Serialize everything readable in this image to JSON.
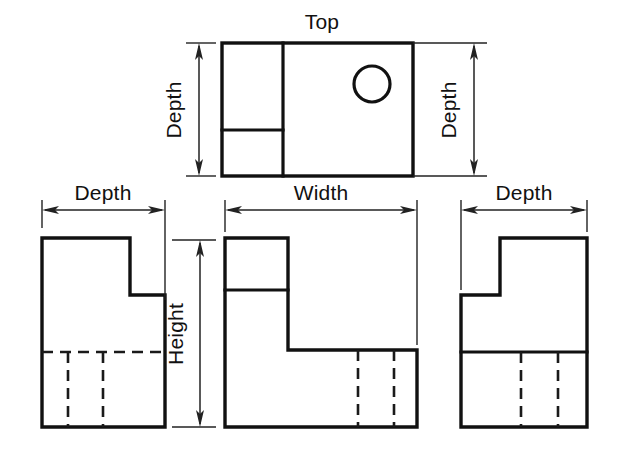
{
  "drawing": {
    "title": "Orthographic Multiview Projection",
    "canvas": {
      "width": 625,
      "height": 458,
      "background": "#ffffff"
    },
    "line_colors": {
      "visible_edge": "#111111",
      "hidden_edge": "#1a1a1a",
      "dimension": "#222222",
      "text": "#111111"
    }
  },
  "labels": {
    "top_view_title": "Top",
    "depth_top_left": "Depth",
    "depth_top_right": "Depth",
    "depth_left_view": "Depth",
    "depth_right_view": "Depth",
    "width_front_view": "Width",
    "height_front_view": "Height"
  },
  "views": {
    "top": {
      "name": "Top",
      "label": "Top",
      "outline_rect": {
        "x": 222,
        "y": 43,
        "width": 191,
        "height": 133
      },
      "vertical_divider_x": 283,
      "horizontal_divider": {
        "x1": 222,
        "x2": 283,
        "y": 130
      },
      "hole": {
        "cx": 372,
        "cy": 84,
        "r": 18,
        "type": "circle",
        "name": "through-hole"
      }
    },
    "front": {
      "name": "Front",
      "outline_points": "225,238 288,238 288,350 417,350 417,427 225,427",
      "notch_line": {
        "x1": 225,
        "x2": 288,
        "y": 290
      },
      "hidden_vertical_lines": [
        {
          "x": 358,
          "y1": 350,
          "y2": 427
        },
        {
          "x": 394,
          "y1": 350,
          "y2": 427
        }
      ]
    },
    "left": {
      "name": "Left Side",
      "outline_points": "42,238 130,238 130,295 165,295 165,427 42,427",
      "hidden_horizontal_line": {
        "x1": 42,
        "x2": 165,
        "y": 352
      },
      "hidden_vertical_lines": [
        {
          "x": 68,
          "y1": 352,
          "y2": 427
        },
        {
          "x": 103,
          "y1": 352,
          "y2": 427
        }
      ]
    },
    "right": {
      "name": "Right Side",
      "outline_points": "461,295 500,295 500,238 587,238 587,427 461,427",
      "visible_horizontal_line": {
        "x1": 461,
        "x2": 587,
        "y": 352
      },
      "hidden_vertical_lines": [
        {
          "x": 521,
          "y1": 352,
          "y2": 427
        },
        {
          "x": 558,
          "y1": 352,
          "y2": 427
        }
      ]
    }
  },
  "dimensions": [
    {
      "id": "depth-top-left",
      "label": "Depth",
      "orientation": "vertical",
      "measures": "depth",
      "line": {
        "x": 199,
        "y1": 43,
        "y2": 176
      },
      "text_position": {
        "x": 181,
        "y": 110
      },
      "text_rotation": -90
    },
    {
      "id": "depth-top-right",
      "label": "Depth",
      "orientation": "vertical",
      "measures": "depth",
      "line": {
        "x": 474,
        "y1": 43,
        "y2": 176
      },
      "text_position": {
        "x": 455,
        "y": 110
      },
      "text_rotation": -90
    },
    {
      "id": "depth-left-view",
      "label": "Depth",
      "orientation": "horizontal",
      "measures": "depth",
      "line": {
        "y": 210,
        "x1": 42,
        "x2": 165
      },
      "text_position": {
        "x": 103,
        "y": 202
      },
      "text_rotation": 0
    },
    {
      "id": "width-front-view",
      "label": "Width",
      "orientation": "horizontal",
      "measures": "width",
      "line": {
        "y": 210,
        "x1": 225,
        "x2": 417
      },
      "text_position": {
        "x": 321,
        "y": 202
      },
      "text_rotation": 0
    },
    {
      "id": "depth-right-view",
      "label": "Depth",
      "orientation": "horizontal",
      "measures": "depth",
      "line": {
        "y": 210,
        "x1": 461,
        "x2": 587
      },
      "text_position": {
        "x": 524,
        "y": 202
      },
      "text_rotation": 0
    },
    {
      "id": "height-front-view",
      "label": "Height",
      "orientation": "vertical",
      "measures": "height",
      "line": {
        "x": 200,
        "y1": 240,
        "y2": 427
      },
      "text_position": {
        "x": 182,
        "y": 334
      },
      "text_rotation": -90
    }
  ]
}
